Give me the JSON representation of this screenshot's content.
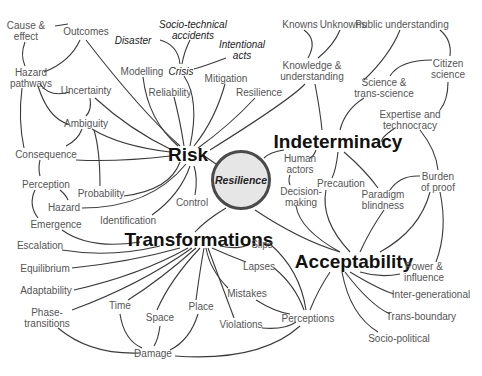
{
  "diagram": {
    "center": {
      "label": "Resilience",
      "fill": "#e6e6e6",
      "border": "#4a4a4a"
    },
    "hubs": {
      "risk": "Risk",
      "indeterminacy": "Indeterminacy",
      "transformations": "Transformations",
      "acceptability": "Acceptability"
    },
    "nodes": {
      "cause_effect": "Cause &\neffect",
      "outcomes": "Outcomes",
      "hazard_pathways": "Hazard\npathways",
      "uncertainty": "Uncertainty",
      "ambiguity": "Ambiguity",
      "consequence": "Consequence",
      "perception": "Perception",
      "probability": "Probability",
      "hazard": "Hazard",
      "emergence": "Emergence",
      "identification": "Identification",
      "control": "Control",
      "disaster": "Disaster",
      "socio_technical": "Socio-technical\naccidents",
      "intentional_acts": "Intentional\nacts",
      "crisis": "Crisis",
      "modelling": "Modelling",
      "reliability": "Reliability",
      "mitigation": "Mitigation",
      "resilience_node": "Resilience",
      "knowns": "Knowns",
      "unknowns": "Unknowns",
      "knowledge": "Knowledge &\nunderstanding",
      "public_understanding": "Public understanding",
      "citizen_science": "Citizen\nscience",
      "science_trans": "Science &\ntrans-science",
      "expertise": "Expertise and\ntechnocracy",
      "burden_proof": "Burden\nof proof",
      "human_actors": "Human\nactors",
      "precaution": "Precaution",
      "paradigm": "Paradigm\nblindness",
      "decision_making": "Decision-\nmaking",
      "escalation": "Escalation",
      "equilibrium": "Equilibrium",
      "adaptability": "Adaptability",
      "phase_transitions": "Phase-\ntransitions",
      "time": "Time",
      "space": "Space",
      "place": "Place",
      "damage": "Damage",
      "slips": "Slips",
      "lapses": "Lapses",
      "mistakes": "Mistakes",
      "violations": "Violations",
      "perceptions": "Perceptions",
      "power_influence": "Power &\ninfluence",
      "inter_generational": "Inter-generational",
      "trans_boundary": "Trans-boundary",
      "socio_political": "Socio-political"
    },
    "colors": {
      "edge": "#3a3a3a",
      "label": "#555555",
      "hub": "#111111"
    }
  }
}
